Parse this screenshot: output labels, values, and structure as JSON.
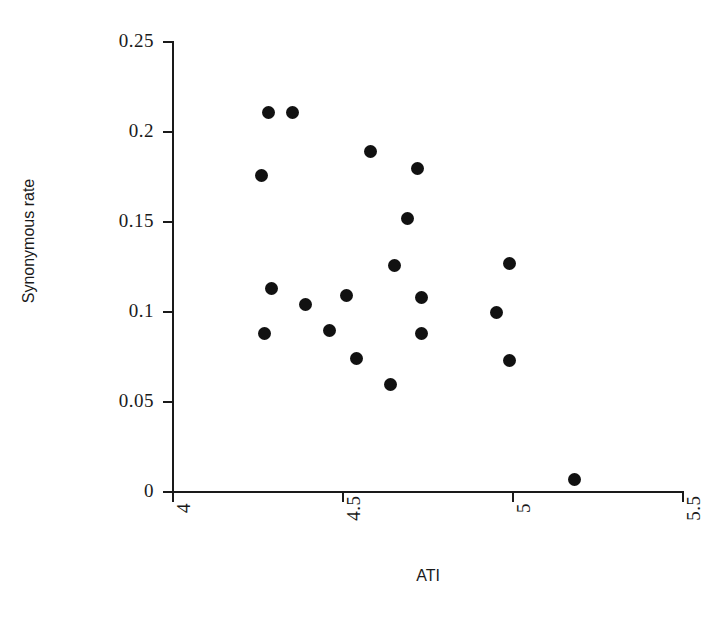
{
  "chart_data": {
    "type": "scatter",
    "title": "",
    "xlabel": "ATI",
    "ylabel": "Synonymous rate",
    "xlim": [
      4,
      5.5
    ],
    "ylim": [
      0,
      0.25
    ],
    "grid": false,
    "legend": null,
    "xticks": [
      "4",
      "4.5",
      "5",
      "5.5"
    ],
    "xtick_values": [
      4,
      4.5,
      5,
      5.5
    ],
    "yticks": [
      "0.25",
      "0.2",
      "0.15",
      "0.1",
      "0.05",
      "0"
    ],
    "ytick_values": [
      0.25,
      0.2,
      0.15,
      0.1,
      0.05,
      0
    ],
    "marker": {
      "shape": "circle",
      "color": "#111111",
      "size_px": 13
    },
    "point_count": 20,
    "x": [
      4.28,
      4.35,
      4.26,
      4.58,
      4.72,
      4.69,
      4.65,
      4.99,
      4.29,
      4.39,
      4.51,
      4.73,
      4.95,
      4.27,
      4.46,
      4.73,
      4.54,
      4.99,
      4.64,
      5.18
    ],
    "y": [
      0.211,
      0.211,
      0.176,
      0.189,
      0.18,
      0.152,
      0.126,
      0.127,
      0.113,
      0.104,
      0.109,
      0.108,
      0.1,
      0.088,
      0.09,
      0.088,
      0.074,
      0.073,
      0.06,
      0.007
    ],
    "points": [
      {
        "x": 4.28,
        "y": 0.211
      },
      {
        "x": 4.35,
        "y": 0.211
      },
      {
        "x": 4.26,
        "y": 0.176
      },
      {
        "x": 4.58,
        "y": 0.189
      },
      {
        "x": 4.72,
        "y": 0.18
      },
      {
        "x": 4.69,
        "y": 0.152
      },
      {
        "x": 4.65,
        "y": 0.126
      },
      {
        "x": 4.99,
        "y": 0.127
      },
      {
        "x": 4.29,
        "y": 0.113
      },
      {
        "x": 4.39,
        "y": 0.104
      },
      {
        "x": 4.51,
        "y": 0.109
      },
      {
        "x": 4.73,
        "y": 0.108
      },
      {
        "x": 4.95,
        "y": 0.1
      },
      {
        "x": 4.27,
        "y": 0.088
      },
      {
        "x": 4.46,
        "y": 0.09
      },
      {
        "x": 4.73,
        "y": 0.088
      },
      {
        "x": 4.54,
        "y": 0.074
      },
      {
        "x": 4.99,
        "y": 0.073
      },
      {
        "x": 4.64,
        "y": 0.06
      },
      {
        "x": 5.18,
        "y": 0.007
      }
    ]
  },
  "axes": {
    "x_title": "ATI",
    "y_title": "Synonymous rate",
    "axis_color": "#1a1a1a"
  },
  "colors": {
    "background": "#ffffff",
    "marker": "#111111",
    "axis": "#1a1a1a"
  }
}
